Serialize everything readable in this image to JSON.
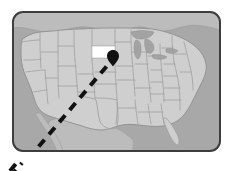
{
  "figure": {
    "kind": "us-map-callout",
    "title": "United States map with highlighted state and pointer line",
    "background_color": "#ffffff"
  },
  "frame": {
    "name": "map-frame",
    "border_color": "#3d3d3d",
    "border_width": 2,
    "corner_radius": 11,
    "x": 12,
    "y": 11,
    "width": 209,
    "height": 141
  },
  "map": {
    "name": "us-map",
    "ocean_color": "#a8a8a8",
    "land_color": "#cfcfcf",
    "neighbor_land_color": "#bcbcbc",
    "state_border_color": "#a0a0a0",
    "country_border_color": "#8f8f8f",
    "lake_color": "#a3a3a3",
    "highlight_color": "#ffffff",
    "highlight_state": "South Dakota",
    "highlight_state_abbr": "SD",
    "regions": [
      "contiguous-united-states",
      "canada",
      "mexico",
      "great-lakes",
      "gulf-of-mexico",
      "pacific-ocean",
      "atlantic-ocean"
    ]
  },
  "marker": {
    "name": "location-pin",
    "color": "#111111",
    "x": 113,
    "y": 58,
    "label": "South Dakota"
  },
  "callout_line": {
    "name": "dashed-pointer-line",
    "color": "#111111",
    "style": "dashed",
    "stroke_width": 4,
    "dash_length": 9,
    "gap_length": 7,
    "from": {
      "x": 18,
      "y": 171
    },
    "to": {
      "x": 112,
      "y": 60
    },
    "exits_frame": true,
    "exit_corner": "bottom-left"
  }
}
